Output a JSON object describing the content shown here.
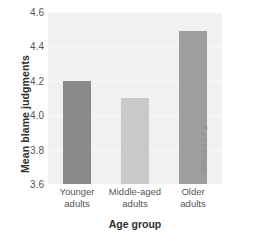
{
  "credit": "© 2019 Cengage",
  "chart_data": {
    "type": "bar",
    "title": "",
    "xlabel": "Age group",
    "ylabel": "Mean blame judgments",
    "categories": [
      "Younger adults",
      "Middle-aged adults",
      "Older adults"
    ],
    "category_lines": [
      [
        "Younger",
        "adults"
      ],
      [
        "Middle-aged",
        "adults"
      ],
      [
        "Older",
        "adults"
      ]
    ],
    "values": [
      4.2,
      4.1,
      4.49
    ],
    "bar_colors": [
      "#8a8a8a",
      "#c9c9c9",
      "#9e9e9e"
    ],
    "ylim": [
      3.6,
      4.6
    ],
    "yticks": [
      3.6,
      3.8,
      4.0,
      4.2,
      4.4,
      4.6
    ],
    "ytick_labels": [
      "3.6",
      "3.8",
      "4.0",
      "4.2",
      "4.4",
      "4.6"
    ],
    "grid": true,
    "legend": "none",
    "plot_background": "#f1f1f1",
    "gridline_color": "#fbfbfb"
  }
}
